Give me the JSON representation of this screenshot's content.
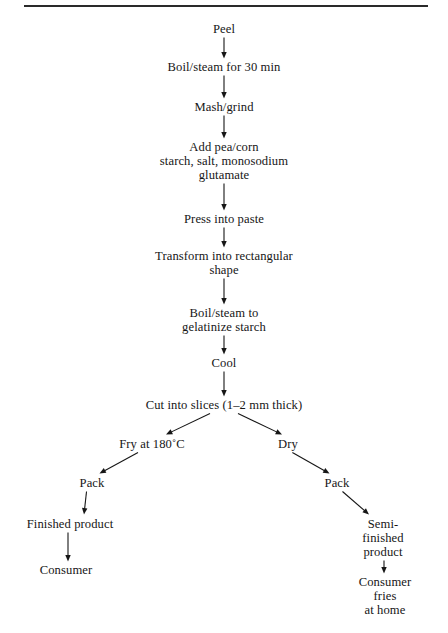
{
  "page": {
    "ink_color": "#161616",
    "background_color": "#ffffff",
    "rule_color": "#2a2a2a"
  },
  "divider": {
    "name": "top-horizontal-rule"
  },
  "chart_data": {
    "type": "diagram",
    "layout": "top-down flowchart with one binary split into fry and dry branches",
    "nodes": [
      {
        "id": "peel",
        "label": "Peel",
        "x": 224,
        "y": 32
      },
      {
        "id": "boil1",
        "label": "Boil/steam for 30 min",
        "x": 224,
        "y": 70
      },
      {
        "id": "mash",
        "label": "Mash/grind",
        "x": 224,
        "y": 110
      },
      {
        "id": "add",
        "label": "Add pea/corn\nstarch, salt, monosodium\nglutamate",
        "x": 224,
        "y": 150
      },
      {
        "id": "press",
        "label": "Press into paste",
        "x": 224,
        "y": 222
      },
      {
        "id": "transform",
        "label": "Transform into rectangular\nshape",
        "x": 224,
        "y": 259
      },
      {
        "id": "boil2",
        "label": "Boil/steam to\ngelatinize starch",
        "x": 224,
        "y": 316
      },
      {
        "id": "cool",
        "label": "Cool",
        "x": 224,
        "y": 366
      },
      {
        "id": "cut",
        "label": "Cut into slices (1–2 mm thick)",
        "x": 224,
        "y": 408
      },
      {
        "id": "fry",
        "label": "Fry at 180˚C",
        "x": 152,
        "y": 447
      },
      {
        "id": "dry",
        "label": "Dry",
        "x": 288,
        "y": 447
      },
      {
        "id": "pack_left",
        "label": "Pack",
        "x": 92,
        "y": 486
      },
      {
        "id": "pack_right",
        "label": "Pack",
        "x": 337,
        "y": 486
      },
      {
        "id": "finished",
        "label": "Finished product",
        "x": 70,
        "y": 527
      },
      {
        "id": "semi",
        "label": "Semi-finished\nproduct",
        "x": 383,
        "y": 527
      },
      {
        "id": "consumer",
        "label": "Consumer",
        "x": 66,
        "y": 573
      },
      {
        "id": "consumer_fries",
        "label": "Consumer fries\nat home",
        "x": 385,
        "y": 585
      }
    ],
    "edges": [
      {
        "from": "peel",
        "to": "boil1",
        "style": "vertical-arrow"
      },
      {
        "from": "boil1",
        "to": "mash",
        "style": "vertical-arrow"
      },
      {
        "from": "mash",
        "to": "add",
        "style": "vertical-arrow"
      },
      {
        "from": "add",
        "to": "press",
        "style": "vertical-arrow"
      },
      {
        "from": "press",
        "to": "transform",
        "style": "vertical-arrow"
      },
      {
        "from": "transform",
        "to": "boil2",
        "style": "vertical-arrow"
      },
      {
        "from": "boil2",
        "to": "cool",
        "style": "vertical-arrow"
      },
      {
        "from": "cool",
        "to": "cut",
        "style": "vertical-arrow"
      },
      {
        "from": "cut",
        "to": "fry",
        "style": "diagonal-arrow-left"
      },
      {
        "from": "cut",
        "to": "dry",
        "style": "diagonal-arrow-right"
      },
      {
        "from": "fry",
        "to": "pack_left",
        "style": "diagonal-arrow-left"
      },
      {
        "from": "dry",
        "to": "pack_right",
        "style": "diagonal-arrow-right"
      },
      {
        "from": "pack_left",
        "to": "finished",
        "style": "diagonal-arrow-left"
      },
      {
        "from": "pack_right",
        "to": "semi",
        "style": "diagonal-arrow-right"
      },
      {
        "from": "finished",
        "to": "consumer",
        "style": "vertical-arrow"
      },
      {
        "from": "semi",
        "to": "consumer_fries",
        "style": "vertical-arrow"
      }
    ]
  }
}
